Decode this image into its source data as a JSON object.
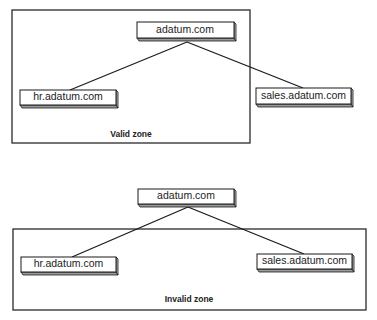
{
  "diagrams": [
    {
      "name": "valid",
      "zone_label": "Valid zone",
      "nodes": {
        "root": "adatum.com",
        "left": "hr.adatum.com",
        "right": "sales.adatum.com"
      }
    },
    {
      "name": "invalid",
      "zone_label": "Invalid zone",
      "nodes": {
        "root": "adatum.com",
        "left": "hr.adatum.com",
        "right": "sales.adatum.com"
      }
    }
  ]
}
